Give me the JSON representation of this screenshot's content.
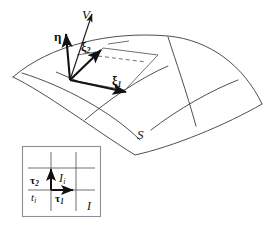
{
  "figure": {
    "stroke_color": "#3b3b3b",
    "bold_stroke_color": "#111111",
    "box_border_color": "#8d8d96",
    "background": "#ffffff"
  },
  "surface": {
    "name": "S",
    "label": "S",
    "description": "curved quadrilateral patch with two families of coordinate curves"
  },
  "vectors": [
    {
      "id": "V",
      "label": "V",
      "sub": "",
      "style": "thin-arrow",
      "description": "vector V pointing up-right from base point"
    },
    {
      "id": "eta",
      "label": "η",
      "sub": "",
      "style": "bold-arrow",
      "description": "vector eta pointing up from base point"
    },
    {
      "id": "xi2",
      "label": "ξ",
      "sub": "2",
      "style": "bold-arrow",
      "description": "tangent vector xi two pointing up-left along surface"
    },
    {
      "id": "xi1",
      "label": "ξ",
      "sub": "1",
      "style": "bold-arrow",
      "description": "tangent vector xi one pointing right-down along surface"
    }
  ],
  "inset": {
    "name": "I",
    "label": "I",
    "cell_label": "I",
    "cell_sub": "i",
    "point_label": "t",
    "point_sub": "i",
    "tangents": [
      {
        "id": "tau1",
        "label": "τ",
        "sub": "1",
        "direction": "right"
      },
      {
        "id": "tau2",
        "label": "τ",
        "sub": "2",
        "direction": "up"
      }
    ]
  }
}
